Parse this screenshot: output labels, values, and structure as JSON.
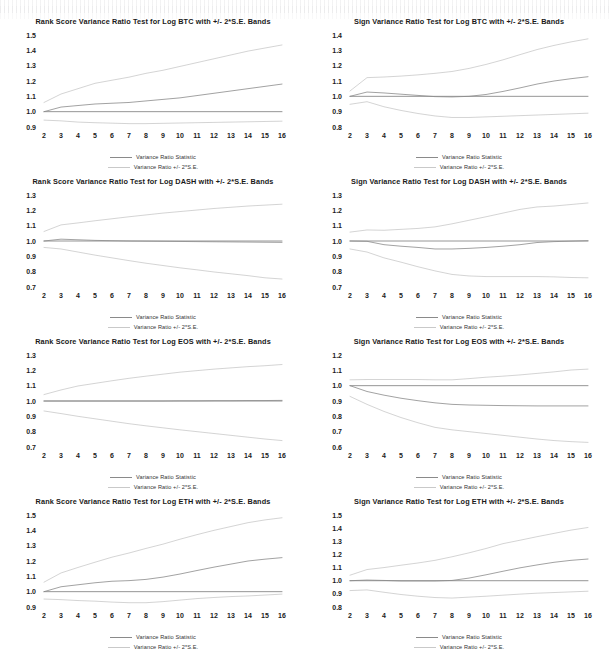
{
  "page": {
    "background": "#ffffff",
    "layout": "4 rows x 2 columns of variance ratio test charts"
  },
  "legend": {
    "statistic_label": "Variance Ratio Statistic",
    "bands_label": "Variance Ratio +/- 2*S.E.",
    "statistic_color": "#8a8a8a",
    "bands_color": "#c9c9c9"
  },
  "axis": {
    "x_ticks": [
      "2",
      "3",
      "4",
      "5",
      "6",
      "7",
      "8",
      "9",
      "10",
      "11",
      "12",
      "13",
      "14",
      "15",
      "16"
    ],
    "xlabel": "",
    "ylabel": ""
  },
  "chart_data": [
    {
      "id": "rank-btc",
      "type": "line",
      "title": "Rank Score Variance Ratio Test for Log BTC with +/- 2*S.E. Bands",
      "xlabel": "",
      "ylabel": "",
      "x": [
        2,
        3,
        4,
        5,
        6,
        7,
        8,
        9,
        10,
        11,
        12,
        13,
        14,
        15,
        16
      ],
      "ylim": [
        0.9,
        1.5
      ],
      "yticks": [
        0.9,
        1.0,
        1.1,
        1.2,
        1.3,
        1.4,
        1.5
      ],
      "ytick_labels": [
        "0.9",
        "1.0",
        "1.1",
        "1.2",
        "1.3",
        "1.4",
        "1.5"
      ],
      "grid": false,
      "legend_position": "bottom-center",
      "series": [
        {
          "name": "Variance Ratio Statistic",
          "role": "statistic",
          "values": [
            1.0,
            1.03,
            1.04,
            1.05,
            1.055,
            1.06,
            1.07,
            1.08,
            1.09,
            1.105,
            1.12,
            1.135,
            1.15,
            1.165,
            1.18
          ]
        },
        {
          "name": "Variance Ratio + 2*S.E.",
          "role": "upper",
          "values": [
            1.06,
            1.115,
            1.15,
            1.185,
            1.205,
            1.225,
            1.25,
            1.27,
            1.295,
            1.32,
            1.345,
            1.37,
            1.395,
            1.415,
            1.435
          ]
        },
        {
          "name": "Variance Ratio - 2*S.E.",
          "role": "lower",
          "values": [
            0.945,
            0.94,
            0.932,
            0.928,
            0.925,
            0.922,
            0.922,
            0.924,
            0.926,
            0.928,
            0.93,
            0.932,
            0.934,
            0.936,
            0.938
          ]
        },
        {
          "name": "Unity reference",
          "role": "unity",
          "values": [
            1.0,
            1.0,
            1.0,
            1.0,
            1.0,
            1.0,
            1.0,
            1.0,
            1.0,
            1.0,
            1.0,
            1.0,
            1.0,
            1.0,
            1.0
          ]
        }
      ]
    },
    {
      "id": "sign-btc",
      "type": "line",
      "title": "Sign Variance Ratio Test for Log BTC with +/- 2*S.E. Bands",
      "xlabel": "",
      "ylabel": "",
      "x": [
        2,
        3,
        4,
        5,
        6,
        7,
        8,
        9,
        10,
        11,
        12,
        13,
        14,
        15,
        16
      ],
      "ylim": [
        0.8,
        1.4
      ],
      "yticks": [
        0.8,
        0.9,
        1.0,
        1.1,
        1.2,
        1.3,
        1.4
      ],
      "ytick_labels": [
        "0.8",
        "0.9",
        "1.0",
        "1.1",
        "1.2",
        "1.3",
        "1.4"
      ],
      "grid": false,
      "legend_position": "bottom-center",
      "series": [
        {
          "name": "Variance Ratio Statistic",
          "role": "statistic",
          "values": [
            1.0,
            1.028,
            1.022,
            1.014,
            1.006,
            0.998,
            0.996,
            1.0,
            1.012,
            1.032,
            1.055,
            1.08,
            1.1,
            1.115,
            1.128
          ]
        },
        {
          "name": "Variance Ratio + 2*S.E.",
          "role": "upper",
          "values": [
            1.035,
            1.122,
            1.126,
            1.132,
            1.14,
            1.15,
            1.162,
            1.182,
            1.208,
            1.238,
            1.272,
            1.305,
            1.332,
            1.355,
            1.375
          ]
        },
        {
          "name": "Variance Ratio - 2*S.E.",
          "role": "lower",
          "values": [
            0.948,
            0.965,
            0.932,
            0.908,
            0.888,
            0.872,
            0.862,
            0.862,
            0.866,
            0.87,
            0.874,
            0.878,
            0.882,
            0.886,
            0.89
          ]
        },
        {
          "name": "Unity reference",
          "role": "unity",
          "values": [
            1.0,
            1.0,
            1.0,
            1.0,
            1.0,
            1.0,
            1.0,
            1.0,
            1.0,
            1.0,
            1.0,
            1.0,
            1.0,
            1.0,
            1.0
          ]
        }
      ]
    },
    {
      "id": "rank-dash",
      "type": "line",
      "title": "Rank Score Variance Ratio Test for Log DASH with +/- 2*S.E. Bands",
      "xlabel": "",
      "ylabel": "",
      "x": [
        2,
        3,
        4,
        5,
        6,
        7,
        8,
        9,
        10,
        11,
        12,
        13,
        14,
        15,
        16
      ],
      "ylim": [
        0.7,
        1.3
      ],
      "yticks": [
        0.7,
        0.8,
        0.9,
        1.0,
        1.1,
        1.2,
        1.3
      ],
      "ytick_labels": [
        "0.7",
        "0.8",
        "0.9",
        "1.0",
        "1.1",
        "1.2",
        "1.3"
      ],
      "grid": false,
      "legend_position": "bottom-center",
      "series": [
        {
          "name": "Variance Ratio Statistic",
          "role": "statistic",
          "values": [
            1.0,
            1.012,
            1.008,
            1.004,
            1.002,
            1.0,
            0.999,
            0.998,
            0.997,
            0.996,
            0.995,
            0.994,
            0.993,
            0.992,
            0.991
          ]
        },
        {
          "name": "Variance Ratio + 2*S.E.",
          "role": "upper",
          "values": [
            1.062,
            1.105,
            1.118,
            1.132,
            1.145,
            1.158,
            1.17,
            1.182,
            1.192,
            1.202,
            1.212,
            1.22,
            1.228,
            1.234,
            1.24
          ]
        },
        {
          "name": "Variance Ratio - 2*S.E.",
          "role": "lower",
          "values": [
            0.958,
            0.948,
            0.928,
            0.908,
            0.89,
            0.872,
            0.855,
            0.84,
            0.825,
            0.812,
            0.798,
            0.786,
            0.774,
            0.76,
            0.752
          ]
        },
        {
          "name": "Unity reference",
          "role": "unity",
          "values": [
            1.0,
            1.0,
            1.0,
            1.0,
            1.0,
            1.0,
            1.0,
            1.0,
            1.0,
            1.0,
            1.0,
            1.0,
            1.0,
            1.0,
            1.0
          ]
        }
      ]
    },
    {
      "id": "sign-dash",
      "type": "line",
      "title": "Sign Variance Ratio Test for Log DASH with +/- 2*S.E. Bands",
      "xlabel": "",
      "ylabel": "",
      "x": [
        2,
        3,
        4,
        5,
        6,
        7,
        8,
        9,
        10,
        11,
        12,
        13,
        14,
        15,
        16
      ],
      "ylim": [
        0.7,
        1.3
      ],
      "yticks": [
        0.7,
        0.8,
        0.9,
        1.0,
        1.1,
        1.2,
        1.3
      ],
      "ytick_labels": [
        "0.7",
        "0.8",
        "0.9",
        "1.0",
        "1.1",
        "1.2",
        "1.3"
      ],
      "grid": false,
      "legend_position": "bottom-center",
      "series": [
        {
          "name": "Variance Ratio Statistic",
          "role": "statistic",
          "values": [
            1.0,
            0.998,
            0.976,
            0.966,
            0.958,
            0.948,
            0.948,
            0.952,
            0.958,
            0.966,
            0.976,
            0.99,
            0.996,
            0.999,
            1.002
          ]
        },
        {
          "name": "Variance Ratio + 2*S.E.",
          "role": "upper",
          "values": [
            1.058,
            1.072,
            1.07,
            1.076,
            1.082,
            1.092,
            1.112,
            1.135,
            1.158,
            1.182,
            1.206,
            1.222,
            1.228,
            1.238,
            1.248
          ]
        },
        {
          "name": "Variance Ratio - 2*S.E.",
          "role": "lower",
          "values": [
            0.948,
            0.928,
            0.89,
            0.862,
            0.832,
            0.805,
            0.782,
            0.772,
            0.768,
            0.768,
            0.768,
            0.768,
            0.766,
            0.762,
            0.76
          ]
        },
        {
          "name": "Unity reference",
          "role": "unity",
          "values": [
            1.0,
            1.0,
            1.0,
            1.0,
            1.0,
            1.0,
            1.0,
            1.0,
            1.0,
            1.0,
            1.0,
            1.0,
            1.0,
            1.0,
            1.0
          ]
        }
      ]
    },
    {
      "id": "rank-eos",
      "type": "line",
      "title": "Rank Score Variance Ratio Test for Log EOS with +/- 2*S.E. Bands",
      "xlabel": "",
      "ylabel": "",
      "x": [
        2,
        3,
        4,
        5,
        6,
        7,
        8,
        9,
        10,
        11,
        12,
        13,
        14,
        15,
        16
      ],
      "ylim": [
        0.7,
        1.3
      ],
      "yticks": [
        0.7,
        0.8,
        0.9,
        1.0,
        1.1,
        1.2,
        1.3
      ],
      "ytick_labels": [
        "0.7",
        "0.8",
        "0.9",
        "1.0",
        "1.1",
        "1.2",
        "1.3"
      ],
      "grid": false,
      "legend_position": "bottom-center",
      "series": [
        {
          "name": "Variance Ratio Statistic",
          "role": "statistic",
          "values": [
            1.0,
            1.0,
            1.0,
            1.0,
            1.0,
            1.0,
            1.0,
            1.0,
            1.001,
            1.001,
            1.002,
            1.002,
            1.003,
            1.003,
            1.004
          ]
        },
        {
          "name": "Variance Ratio + 2*S.E.",
          "role": "upper",
          "values": [
            1.042,
            1.072,
            1.098,
            1.115,
            1.132,
            1.148,
            1.162,
            1.175,
            1.188,
            1.198,
            1.208,
            1.216,
            1.224,
            1.23,
            1.238
          ]
        },
        {
          "name": "Variance Ratio - 2*S.E.",
          "role": "lower",
          "values": [
            0.935,
            0.918,
            0.9,
            0.884,
            0.868,
            0.852,
            0.838,
            0.825,
            0.812,
            0.8,
            0.788,
            0.776,
            0.764,
            0.752,
            0.742
          ]
        },
        {
          "name": "Unity reference",
          "role": "unity",
          "values": [
            1.0,
            1.0,
            1.0,
            1.0,
            1.0,
            1.0,
            1.0,
            1.0,
            1.0,
            1.0,
            1.0,
            1.0,
            1.0,
            1.0,
            1.0
          ]
        }
      ]
    },
    {
      "id": "sign-eos",
      "type": "line",
      "title": "Sign Variance Ratio Test for Log EOS with +/- 2*S.E. Bands",
      "xlabel": "",
      "ylabel": "",
      "x": [
        2,
        3,
        4,
        5,
        6,
        7,
        8,
        9,
        10,
        11,
        12,
        13,
        14,
        15,
        16
      ],
      "ylim": [
        0.6,
        1.2
      ],
      "yticks": [
        0.6,
        0.7,
        0.8,
        0.9,
        1.0,
        1.1,
        1.2
      ],
      "ytick_labels": [
        "0.6",
        "0.7",
        "0.8",
        "0.9",
        "1.0",
        "1.1",
        "1.2"
      ],
      "grid": false,
      "legend_position": "bottom-center",
      "series": [
        {
          "name": "Variance Ratio Statistic",
          "role": "statistic",
          "values": [
            1.0,
            0.962,
            0.938,
            0.918,
            0.902,
            0.888,
            0.878,
            0.874,
            0.872,
            0.87,
            0.869,
            0.868,
            0.868,
            0.868,
            0.868
          ]
        },
        {
          "name": "Variance Ratio + 2*S.E.",
          "role": "upper",
          "values": [
            1.038,
            1.04,
            1.04,
            1.04,
            1.04,
            1.038,
            1.038,
            1.046,
            1.055,
            1.062,
            1.07,
            1.08,
            1.09,
            1.102,
            1.108
          ]
        },
        {
          "name": "Variance Ratio - 2*S.E.",
          "role": "lower",
          "values": [
            0.93,
            0.878,
            0.832,
            0.792,
            0.758,
            0.728,
            0.712,
            0.7,
            0.688,
            0.676,
            0.664,
            0.652,
            0.642,
            0.635,
            0.63
          ]
        },
        {
          "name": "Unity reference",
          "role": "unity",
          "values": [
            1.0,
            1.0,
            1.0,
            1.0,
            1.0,
            1.0,
            1.0,
            1.0,
            1.0,
            1.0,
            1.0,
            1.0,
            1.0,
            1.0,
            1.0
          ]
        }
      ]
    },
    {
      "id": "rank-eth",
      "type": "line",
      "title": "Rank Score Variance Ratio Test for Log ETH with +/- 2*S.E. Bands",
      "xlabel": "",
      "ylabel": "",
      "x": [
        2,
        3,
        4,
        5,
        6,
        7,
        8,
        9,
        10,
        11,
        12,
        13,
        14,
        15,
        16
      ],
      "ylim": [
        0.9,
        1.5
      ],
      "yticks": [
        0.9,
        1.0,
        1.1,
        1.2,
        1.3,
        1.4,
        1.5
      ],
      "ytick_labels": [
        "0.9",
        "1.0",
        "1.1",
        "1.2",
        "1.3",
        "1.4",
        "1.5"
      ],
      "grid": false,
      "legend_position": "bottom-center",
      "series": [
        {
          "name": "Variance Ratio Statistic",
          "role": "statistic",
          "values": [
            1.0,
            1.032,
            1.045,
            1.058,
            1.068,
            1.072,
            1.08,
            1.095,
            1.115,
            1.138,
            1.16,
            1.18,
            1.2,
            1.212,
            1.222
          ]
        },
        {
          "name": "Variance Ratio + 2*S.E.",
          "role": "upper",
          "values": [
            1.062,
            1.122,
            1.158,
            1.192,
            1.225,
            1.252,
            1.282,
            1.31,
            1.342,
            1.372,
            1.4,
            1.425,
            1.45,
            1.468,
            1.482
          ]
        },
        {
          "name": "Variance Ratio - 2*S.E.",
          "role": "lower",
          "values": [
            0.952,
            0.948,
            0.942,
            0.938,
            0.932,
            0.928,
            0.928,
            0.935,
            0.945,
            0.955,
            0.962,
            0.968,
            0.972,
            0.978,
            0.984
          ]
        },
        {
          "name": "Unity reference",
          "role": "unity",
          "values": [
            1.0,
            1.0,
            1.0,
            1.0,
            1.0,
            1.0,
            1.0,
            1.0,
            1.0,
            1.0,
            1.0,
            1.0,
            1.0,
            1.0,
            1.0
          ]
        }
      ]
    },
    {
      "id": "sign-eth",
      "type": "line",
      "title": "Sign Variance Ratio Test for Log ETH with +/- 2*S.E. Bands",
      "xlabel": "",
      "ylabel": "",
      "x": [
        2,
        3,
        4,
        5,
        6,
        7,
        8,
        9,
        10,
        11,
        12,
        13,
        14,
        15,
        16
      ],
      "ylim": [
        0.8,
        1.5
      ],
      "yticks": [
        0.8,
        0.9,
        1.0,
        1.1,
        1.2,
        1.3,
        1.4,
        1.5
      ],
      "ytick_labels": [
        "0.8",
        "0.9",
        "1.0",
        "1.1",
        "1.2",
        "1.3",
        "1.4",
        "1.5"
      ],
      "grid": false,
      "legend_position": "bottom-center",
      "series": [
        {
          "name": "Variance Ratio Statistic",
          "role": "statistic",
          "values": [
            1.0,
            1.005,
            1.002,
            0.998,
            0.998,
            0.998,
            1.002,
            1.02,
            1.045,
            1.072,
            1.098,
            1.12,
            1.14,
            1.155,
            1.165
          ]
        },
        {
          "name": "Variance Ratio + 2*S.E.",
          "role": "upper",
          "values": [
            1.042,
            1.085,
            1.1,
            1.118,
            1.135,
            1.155,
            1.182,
            1.212,
            1.245,
            1.282,
            1.308,
            1.335,
            1.36,
            1.385,
            1.405
          ]
        },
        {
          "name": "Variance Ratio - 2*S.E.",
          "role": "lower",
          "values": [
            0.925,
            0.93,
            0.912,
            0.895,
            0.882,
            0.872,
            0.868,
            0.875,
            0.882,
            0.89,
            0.898,
            0.905,
            0.91,
            0.915,
            0.92
          ]
        },
        {
          "name": "Unity reference",
          "role": "unity",
          "values": [
            1.0,
            1.0,
            1.0,
            1.0,
            1.0,
            1.0,
            1.0,
            1.0,
            1.0,
            1.0,
            1.0,
            1.0,
            1.0,
            1.0,
            1.0
          ]
        }
      ]
    }
  ]
}
